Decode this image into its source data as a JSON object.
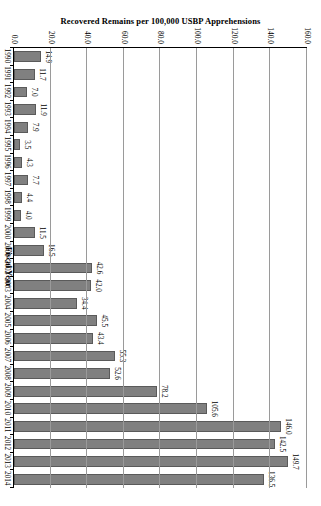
{
  "chart_data": {
    "type": "bar",
    "orientation": "horizontal-rotated",
    "title": "",
    "xlabel": "Fiscal Year",
    "ylabel": "Recovered Remains per 100,000 USBP Apprehensions",
    "ylim": [
      0.0,
      160.0
    ],
    "yticks": [
      "0.0",
      "20.0",
      "40.0",
      "60.0",
      "80.0",
      "100.0",
      "120.0",
      "140.0",
      "160.0"
    ],
    "ytick_values": [
      0,
      20,
      40,
      60,
      80,
      100,
      120,
      140,
      160
    ],
    "grid": true,
    "legend": false,
    "categories": [
      "1990",
      "1991",
      "1992",
      "1993",
      "1994",
      "1995",
      "1996",
      "1997",
      "1998",
      "1999",
      "2000",
      "2001",
      "2002",
      "2003",
      "2004",
      "2005",
      "2006",
      "2007",
      "2008",
      "2009",
      "2010",
      "2011",
      "2012",
      "2013",
      "2014"
    ],
    "values": [
      14.9,
      11.7,
      7.0,
      11.9,
      7.9,
      3.5,
      4.3,
      7.7,
      4.4,
      4.0,
      11.5,
      16.5,
      42.6,
      42.0,
      34.4,
      45.5,
      43.4,
      55.3,
      52.6,
      78.2,
      105.6,
      146.0,
      142.5,
      149.7,
      136.5
    ],
    "data_labels": [
      "14.9",
      "11.7",
      "7.0",
      "11.9",
      "7.9",
      "3.5",
      "4.3",
      "7.7",
      "4.4",
      "4.0",
      "11.5",
      "16.5",
      "42.6",
      "42.0",
      "34.4",
      "45.5",
      "43.4",
      "55.3",
      "52.6",
      "78.2",
      "105.6",
      "146.0",
      "142.5",
      "149.7",
      "136.5"
    ],
    "series": [
      {
        "name": "Recovered Remains per 100,000 USBP Apprehensions",
        "color": "#808080",
        "values": [
          14.9,
          11.7,
          7.0,
          11.9,
          7.9,
          3.5,
          4.3,
          7.7,
          4.4,
          4.0,
          11.5,
          16.5,
          42.6,
          42.0,
          34.4,
          45.5,
          43.4,
          55.3,
          52.6,
          78.2,
          105.6,
          146.0,
          142.5,
          149.7,
          136.5
        ]
      }
    ],
    "colors": {
      "bar_fill": "#808080",
      "bar_border": "#5a5a5a",
      "gridline": "#9a9a9a",
      "axis": "#000000",
      "background": "#ffffff"
    }
  }
}
